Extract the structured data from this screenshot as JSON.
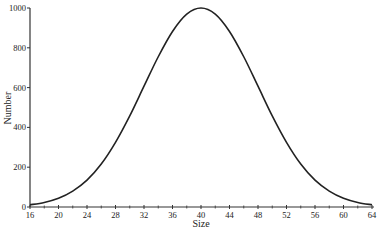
{
  "chart_data": {
    "type": "line",
    "title": "",
    "xlabel": "Size",
    "ylabel": "Number",
    "xlim": [
      16,
      64
    ],
    "ylim": [
      0,
      1000
    ],
    "grid": false,
    "legend": null,
    "x_ticks": [
      16,
      20,
      24,
      28,
      32,
      36,
      40,
      44,
      48,
      52,
      56,
      60,
      64
    ],
    "x_minor_ticks": [
      18,
      22,
      26,
      30,
      34,
      38,
      42,
      46,
      50,
      54,
      58,
      62
    ],
    "y_ticks": [
      0,
      200,
      400,
      600,
      800,
      1000
    ],
    "series": [
      {
        "name": "Number",
        "x": [
          16,
          18,
          20,
          22,
          24,
          26,
          28,
          30,
          32,
          34,
          36,
          38,
          40,
          42,
          44,
          46,
          48,
          50,
          52,
          54,
          56,
          58,
          60,
          62,
          64
        ],
        "values": [
          11,
          23,
          44,
          80,
          135,
          216,
          325,
          458,
          607,
          755,
          882,
          969,
          1000,
          969,
          882,
          755,
          607,
          458,
          325,
          216,
          135,
          80,
          44,
          23,
          11
        ]
      }
    ],
    "colors": {
      "line": "#222222",
      "axis": "#333333",
      "background": "#ffffff"
    }
  }
}
